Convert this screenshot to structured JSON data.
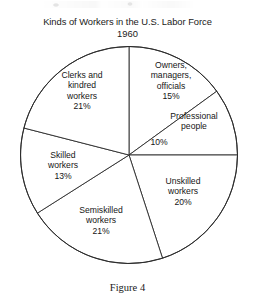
{
  "chart_data": {
    "type": "pie",
    "title": "Kinds of Workers in the U.S. Labor Force",
    "subtitle": "1960",
    "caption": "Figure 4",
    "xlabel": "",
    "ylabel": "",
    "legend_position": "none",
    "grid": false,
    "units": "percent",
    "start_angle_deg": 0,
    "direction": "clockwise",
    "categories": [
      "Owners, managers, officials",
      "Professional people",
      "Unskilled workers",
      "Semiskilled workers",
      "Skilled workers",
      "Clerks and kindred workers"
    ],
    "values": [
      15,
      10,
      20,
      21,
      13,
      21
    ],
    "total": 100,
    "slices": [
      {
        "key": "owners",
        "label_lines": [
          "Owners,",
          "managers,",
          "officials"
        ],
        "value": 15,
        "value_label": "15%",
        "start_deg": 0,
        "end_deg": 54
      },
      {
        "key": "professional",
        "label_lines": [
          "Professional",
          "people"
        ],
        "value": 10,
        "value_label": "10%",
        "start_deg": 54,
        "end_deg": 90
      },
      {
        "key": "unskilled",
        "label_lines": [
          "Unskilled",
          "workers"
        ],
        "value": 20,
        "value_label": "20%",
        "start_deg": 90,
        "end_deg": 162
      },
      {
        "key": "semiskilled",
        "label_lines": [
          "Semiskilled",
          "workers"
        ],
        "value": 21,
        "value_label": "21%",
        "start_deg": 162,
        "end_deg": 237.6
      },
      {
        "key": "skilled",
        "label_lines": [
          "Skilled",
          "workers"
        ],
        "value": 13,
        "value_label": "13%",
        "start_deg": 237.6,
        "end_deg": 284.4
      },
      {
        "key": "clerks",
        "label_lines": [
          "Clerks and",
          "kindred",
          "workers"
        ],
        "value": 21,
        "value_label": "21%",
        "start_deg": 284.4,
        "end_deg": 360
      }
    ],
    "style": {
      "fill": "#ffffff",
      "stroke": "#2b2b2b",
      "background": "#ffffff",
      "text": "#161616"
    }
  },
  "labels": {
    "clerks": {
      "l1": "Clerks and",
      "l2": "kindred",
      "l3": "workers",
      "pct": "21%"
    },
    "owners": {
      "l1": "Owners,",
      "l2": "managers,",
      "l3": "officials",
      "pct": "15%"
    },
    "professional": {
      "l1": "Professional",
      "l2": "people",
      "pct": "10%"
    },
    "unskilled": {
      "l1": "Unskilled",
      "l2": "workers",
      "pct": "20%"
    },
    "semiskilled": {
      "l1": "Semiskilled",
      "l2": "workers",
      "pct": "21%"
    },
    "skilled": {
      "l1": "Skilled",
      "l2": "workers",
      "pct": "13%"
    }
  }
}
